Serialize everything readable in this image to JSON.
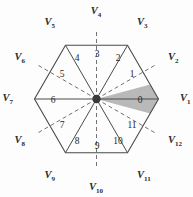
{
  "figure": {
    "shape": "hexagon",
    "center": {
      "x": 96.5,
      "y": 99.0
    },
    "circumradius": 62.0,
    "rotation_deg": 0,
    "colors": {
      "outline": "#4a4a4a",
      "solid_spoke": "#4a4a4a",
      "dashed_spoke": "#737373",
      "shaded_sector_fill": "#b3b3b3",
      "hub": "#3a3a3a",
      "label_text": "#2b2b2b",
      "background": "#fdfdfd"
    },
    "shaded_sector_index": 0
  },
  "vertex_labels": [
    {
      "name": "V1",
      "base": "V",
      "sub": "1",
      "angle_deg": 0,
      "x": 180,
      "y": 101,
      "anchor": "start",
      "kind": "vertex"
    },
    {
      "name": "V2",
      "base": "V",
      "sub": "2",
      "angle_deg": 30,
      "x": 168,
      "y": 60,
      "anchor": "start",
      "kind": "midpoint"
    },
    {
      "name": "V3",
      "base": "V",
      "sub": "3",
      "angle_deg": 60,
      "x": 137,
      "y": 25,
      "anchor": "start",
      "kind": "vertex"
    },
    {
      "name": "V4",
      "base": "V",
      "sub": "4",
      "angle_deg": 90,
      "x": 96,
      "y": 14,
      "anchor": "middle",
      "kind": "midpoint"
    },
    {
      "name": "V5",
      "base": "V",
      "sub": "5",
      "angle_deg": 120,
      "x": 55,
      "y": 25,
      "anchor": "end",
      "kind": "vertex"
    },
    {
      "name": "V6",
      "base": "V",
      "sub": "6",
      "angle_deg": 150,
      "x": 25,
      "y": 60,
      "anchor": "end",
      "kind": "midpoint"
    },
    {
      "name": "V7",
      "base": "V",
      "sub": "7",
      "angle_deg": 180,
      "x": 13,
      "y": 101,
      "anchor": "end",
      "kind": "vertex"
    },
    {
      "name": "V8",
      "base": "V",
      "sub": "8",
      "angle_deg": 210,
      "x": 25,
      "y": 143,
      "anchor": "end",
      "kind": "midpoint"
    },
    {
      "name": "V9",
      "base": "V",
      "sub": "9",
      "angle_deg": 240,
      "x": 55,
      "y": 178,
      "anchor": "end",
      "kind": "vertex"
    },
    {
      "name": "V10",
      "base": "V",
      "sub": "10",
      "angle_deg": 270,
      "x": 96,
      "y": 190,
      "anchor": "middle",
      "kind": "midpoint"
    },
    {
      "name": "V11",
      "base": "V",
      "sub": "11",
      "angle_deg": 300,
      "x": 137,
      "y": 178,
      "anchor": "start",
      "kind": "vertex"
    },
    {
      "name": "V12",
      "base": "V",
      "sub": "12",
      "angle_deg": 330,
      "x": 168,
      "y": 143,
      "anchor": "start",
      "kind": "midpoint"
    }
  ],
  "sector_labels": [
    {
      "name": "0",
      "angle_deg": 0,
      "x": 140,
      "y": 103,
      "shaded": true
    },
    {
      "name": "1",
      "angle_deg": 30,
      "x": 132,
      "y": 77,
      "shaded": false
    },
    {
      "name": "2",
      "angle_deg": 60,
      "x": 118,
      "y": 61,
      "shaded": false
    },
    {
      "name": "3",
      "angle_deg": 90,
      "x": 97,
      "y": 57,
      "shaded": false
    },
    {
      "name": "4",
      "angle_deg": 120,
      "x": 77,
      "y": 61,
      "shaded": false
    },
    {
      "name": "5",
      "angle_deg": 150,
      "x": 62,
      "y": 77,
      "shaded": false
    },
    {
      "name": "6",
      "angle_deg": 180,
      "x": 53,
      "y": 103,
      "shaded": false
    },
    {
      "name": "7",
      "angle_deg": 210,
      "x": 62,
      "y": 128,
      "shaded": false
    },
    {
      "name": "8",
      "angle_deg": 240,
      "x": 77,
      "y": 144,
      "shaded": false
    },
    {
      "name": "9",
      "angle_deg": 270,
      "x": 97,
      "y": 149,
      "shaded": false
    },
    {
      "name": "10",
      "angle_deg": 300,
      "x": 118,
      "y": 144,
      "shaded": false
    },
    {
      "name": "11",
      "angle_deg": 330,
      "x": 132,
      "y": 128,
      "shaded": false
    }
  ]
}
